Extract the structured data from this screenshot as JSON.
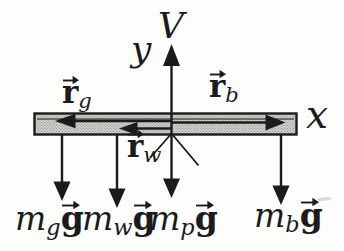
{
  "figure": {
    "background": "#fdfdfc",
    "ink": "#1b1b1b",
    "beam_fill": "#d7d7d4",
    "beam_dot": "#94948f"
  },
  "axis_labels": {
    "v": "V",
    "y": "y",
    "x": "x"
  },
  "position_vectors": {
    "rg": {
      "base": "r",
      "sub": "g"
    },
    "rb": {
      "base": "r",
      "sub": "b"
    },
    "rw": {
      "base": "r",
      "sub": "w"
    }
  },
  "weight_labels": {
    "mg": {
      "m": "m",
      "sub": "g",
      "g": "g"
    },
    "mw": {
      "m": "m",
      "sub": "w",
      "g": "g"
    },
    "mp": {
      "m": "m",
      "sub": "p",
      "g": "g"
    },
    "mb": {
      "m": "m",
      "sub": "b",
      "g": "g"
    }
  }
}
